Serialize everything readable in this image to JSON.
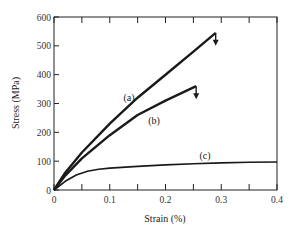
{
  "chart_data": {
    "type": "line",
    "title": "",
    "xlabel": "Strain (%)",
    "ylabel": "Stress (MPa)",
    "xlim": [
      0,
      0.4
    ],
    "ylim": [
      0,
      600
    ],
    "x_ticks": [
      "0",
      "0.1",
      "0.2",
      "0.3",
      "0.4"
    ],
    "y_ticks": [
      "0",
      "100",
      "200",
      "300",
      "400",
      "500",
      "600"
    ],
    "grid": false,
    "legend": "none (inline curve labels)",
    "series": [
      {
        "name": "(a)",
        "label": "(a)",
        "x": [
          0,
          0.02,
          0.05,
          0.1,
          0.15,
          0.2,
          0.25,
          0.29
        ],
        "y": [
          0,
          60,
          130,
          230,
          320,
          400,
          480,
          545
        ],
        "end_marker": "fracture-arrow-down"
      },
      {
        "name": "(b)",
        "label": "(b)",
        "x": [
          0,
          0.02,
          0.05,
          0.1,
          0.15,
          0.2,
          0.255
        ],
        "y": [
          0,
          50,
          110,
          190,
          260,
          310,
          360
        ],
        "end_marker": "fracture-arrow-down"
      },
      {
        "name": "(c)",
        "label": "(c)",
        "x": [
          0,
          0.02,
          0.04,
          0.06,
          0.08,
          0.1,
          0.15,
          0.2,
          0.25,
          0.3,
          0.35,
          0.4
        ],
        "y": [
          0,
          30,
          52,
          65,
          72,
          76,
          82,
          87,
          91,
          94,
          96,
          97
        ]
      }
    ],
    "annotations": [
      "(a)",
      "(b)",
      "(c)"
    ]
  }
}
